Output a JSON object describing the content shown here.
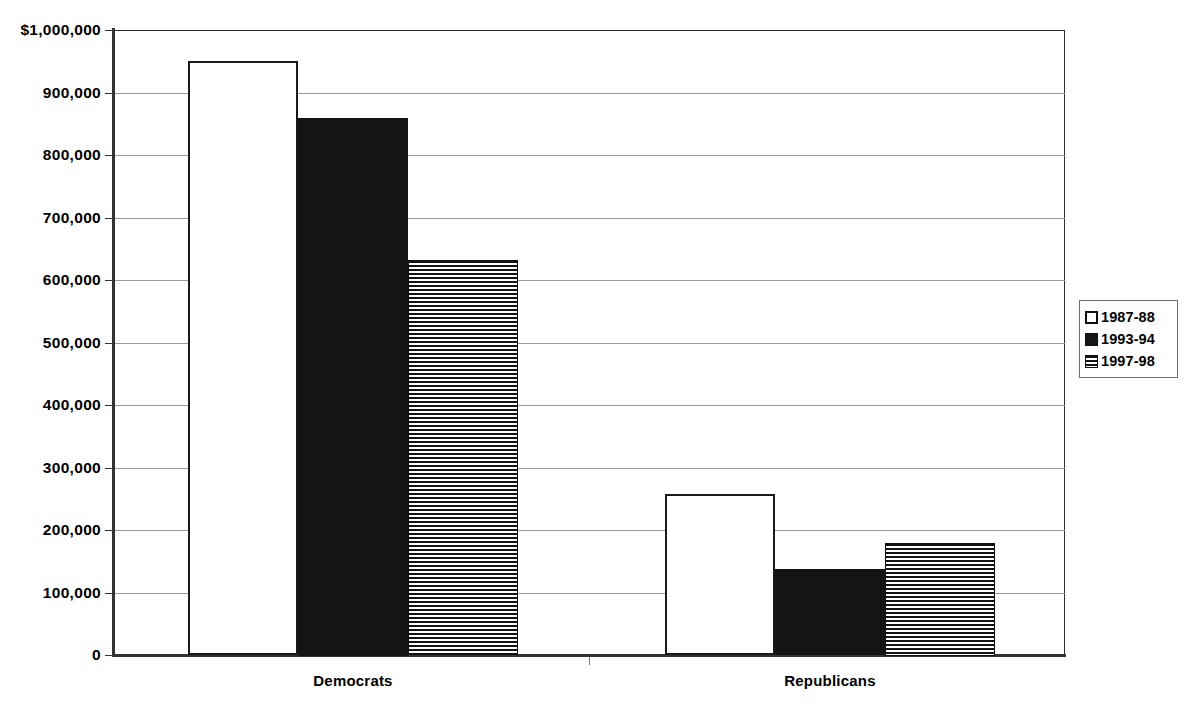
{
  "chart_data": {
    "type": "bar",
    "title": "",
    "subtitle": "",
    "xlabel": "",
    "ylabel": "",
    "categories": [
      "Democrats",
      "Republicans"
    ],
    "series": [
      {
        "name": "1987-88",
        "fill": "open",
        "values": [
          950000,
          257000
        ]
      },
      {
        "name": "1993-94",
        "fill": "solid",
        "values": [
          860000,
          138000
        ]
      },
      {
        "name": "1997-98",
        "fill": "stripe",
        "values": [
          632000,
          180000
        ]
      }
    ],
    "ylim": [
      0,
      1000000
    ],
    "ytick_values": [
      0,
      100000,
      200000,
      300000,
      400000,
      500000,
      600000,
      700000,
      800000,
      900000,
      1000000
    ],
    "ytick_labels": [
      "0",
      "100,000",
      "200,000",
      "300,000",
      "400,000",
      "500,000",
      "600,000",
      "700,000",
      "800,000",
      "900,000",
      "$1,000,000"
    ],
    "grid": true,
    "legend_position": "right",
    "colors": {
      "axis": "#333333",
      "gridline": "#9a9a9a",
      "bar_outline": "#1a1a1a",
      "bar_solid": "#141414",
      "text": "#000000",
      "background": "#ffffff"
    }
  },
  "legend": {
    "items": [
      {
        "label": "1987-88",
        "fill": "open"
      },
      {
        "label": "1993-94",
        "fill": "solid"
      },
      {
        "label": "1997-98",
        "fill": "stripe"
      }
    ]
  },
  "axis": {
    "y_labels": [
      "$1,000,000",
      "900,000",
      "800,000",
      "700,000",
      "600,000",
      "500,000",
      "400,000",
      "300,000",
      "200,000",
      "100,000",
      "0"
    ],
    "x_labels": [
      "Democrats",
      "Republicans"
    ]
  }
}
